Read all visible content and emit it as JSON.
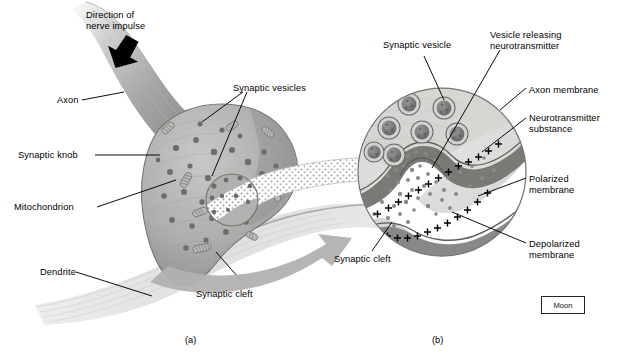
{
  "figure": {
    "credit_box": "Moon",
    "panel_a_caption": "(a)",
    "panel_b_caption": "(b)"
  },
  "panel_a": {
    "labels": [
      {
        "id": "direction-of-nerve-impulse",
        "text": "Direction of\nnerve impulse",
        "x": 86,
        "y": 10
      },
      {
        "id": "axon",
        "text": "Axon",
        "x": 57,
        "y": 95
      },
      {
        "id": "synaptic-vesicles",
        "text": "Synaptic vesicles",
        "x": 233,
        "y": 83
      },
      {
        "id": "synaptic-knob",
        "text": "Synaptic knob",
        "x": 18,
        "y": 150
      },
      {
        "id": "mitochondrion",
        "text": "Mitochondrion",
        "x": 14,
        "y": 202
      },
      {
        "id": "dendrite",
        "text": "Dendrite",
        "x": 40,
        "y": 267
      },
      {
        "id": "synaptic-cleft",
        "text": "Synaptic cleft",
        "x": 196,
        "y": 289
      }
    ]
  },
  "panel_b": {
    "labels": [
      {
        "id": "synaptic-vesicle",
        "text": "Synaptic vesicle",
        "x": 383,
        "y": 40
      },
      {
        "id": "vesicle-releasing-neurotransmitter",
        "text": "Vesicle releasing\nneurotransmitter",
        "x": 490,
        "y": 30
      },
      {
        "id": "axon-membrane",
        "text": "Axon membrane",
        "x": 529,
        "y": 85
      },
      {
        "id": "neurotransmitter-substance",
        "text": "Neurotransmitter\nsubstance",
        "x": 529,
        "y": 113
      },
      {
        "id": "polarized-membrane",
        "text": "Polarized\nmembrane",
        "x": 529,
        "y": 174
      },
      {
        "id": "depolarized-membrane",
        "text": "Depolarized\nmembrane",
        "x": 529,
        "y": 239
      },
      {
        "id": "synaptic-cleft",
        "text": "Synaptic cleft",
        "x": 334,
        "y": 254
      }
    ]
  },
  "colors": {
    "ink": "#000000",
    "axon_fill": "#a9a9ab",
    "knob_fill": "#b3b2b1",
    "knob_dark": "#8e8d8c",
    "vesicle_dot": "#6f6e6d",
    "membrane_line": "#6d6b6a",
    "cleft_fill": "#ffffff",
    "dendrite_fill": "#d9d9d9",
    "inset_fill": "#dcdbd9",
    "arrow_gray": "#b0afae"
  }
}
